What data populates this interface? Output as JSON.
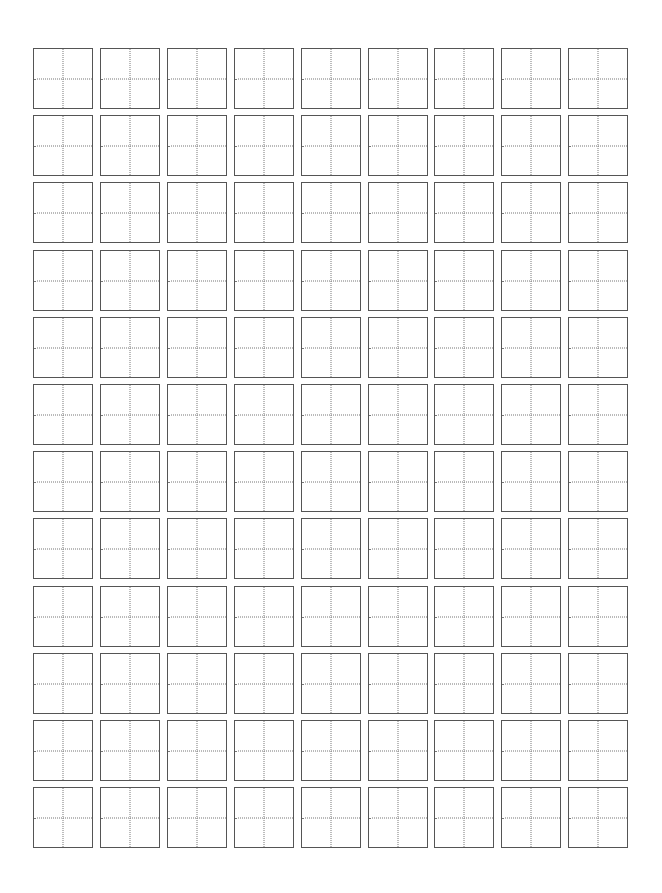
{
  "page": {
    "type": "tianzige-practice-sheet",
    "background_color": "#ffffff"
  },
  "grid": {
    "columns": 9,
    "rows": 12,
    "origin_x": 33,
    "origin_y": 48,
    "pitch_x": 66.9,
    "pitch_y": 67.2,
    "cell_width": 60,
    "cell_height": 61,
    "border_color": "#555555",
    "guide_color": "#777777",
    "guide_style": "dotted"
  }
}
